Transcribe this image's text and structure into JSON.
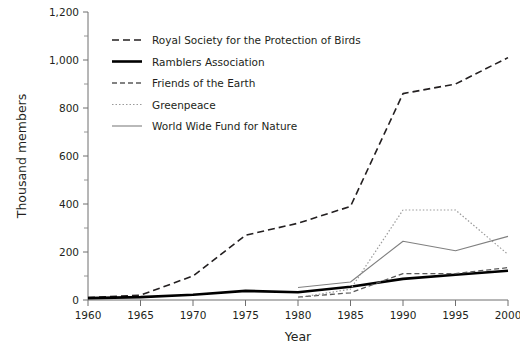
{
  "chart_data": {
    "type": "line",
    "title": "",
    "xlabel": "Year",
    "ylabel": "Thousand members",
    "xlim": [
      1960,
      2000
    ],
    "ylim": [
      0,
      1200
    ],
    "x_ticks": [
      1960,
      1965,
      1970,
      1975,
      1980,
      1985,
      1990,
      1995,
      2000
    ],
    "x_tick_labels": [
      "1960",
      "1965",
      "1970",
      "1975",
      "1980",
      "1985",
      "1990",
      "1995",
      "2000"
    ],
    "y_ticks": [
      0,
      200,
      400,
      600,
      800,
      1000,
      1200
    ],
    "y_tick_labels": [
      "0",
      "200",
      "400",
      "600",
      "800",
      "1,000",
      "1,200"
    ],
    "y_minor_ticks": [
      100,
      300,
      500,
      700,
      900,
      1100
    ],
    "grid": false,
    "legend_position": "upper-left-inside",
    "series": [
      {
        "name": "Royal Society for the Protection of Birds",
        "style": "dashed",
        "color": "#231f20",
        "width": 1.6,
        "dash": "7,4",
        "x": [
          1960,
          1965,
          1970,
          1975,
          1980,
          1985,
          1990,
          1995,
          2000
        ],
        "values": [
          10,
          20,
          100,
          270,
          320,
          390,
          860,
          900,
          1010
        ]
      },
      {
        "name": "Ramblers Association",
        "style": "solid-thick",
        "color": "#000000",
        "width": 2.6,
        "dash": "",
        "x": [
          1960,
          1965,
          1970,
          1975,
          1980,
          1985,
          1990,
          1995,
          2000
        ],
        "values": [
          8,
          12,
          22,
          38,
          32,
          55,
          88,
          105,
          122
        ]
      },
      {
        "name": "Friends of the Earth",
        "style": "dashed-thin",
        "color": "#5a5a5a",
        "width": 1.3,
        "dash": "5,3",
        "x": [
          1980,
          1985,
          1990,
          1995,
          2000
        ],
        "values": [
          12,
          30,
          110,
          110,
          135
        ]
      },
      {
        "name": "Greenpeace",
        "style": "dotted",
        "color": "#9a9a9a",
        "width": 1.2,
        "dash": "1.5,2",
        "x": [
          1980,
          1985,
          1990,
          1995,
          2000
        ],
        "values": [
          10,
          45,
          375,
          375,
          190
        ]
      },
      {
        "name": "World Wide Fund for Nature",
        "style": "solid-thin",
        "color": "#808080",
        "width": 1.1,
        "dash": "",
        "x": [
          1980,
          1985,
          1990,
          1995,
          2000
        ],
        "values": [
          52,
          75,
          245,
          205,
          265
        ]
      }
    ]
  },
  "legend": {
    "items": [
      {
        "label": "Royal Society for the Protection of Birds"
      },
      {
        "label": "Ramblers Association"
      },
      {
        "label": "Friends of the Earth"
      },
      {
        "label": "Greenpeace"
      },
      {
        "label": "World Wide Fund for Nature"
      }
    ]
  }
}
